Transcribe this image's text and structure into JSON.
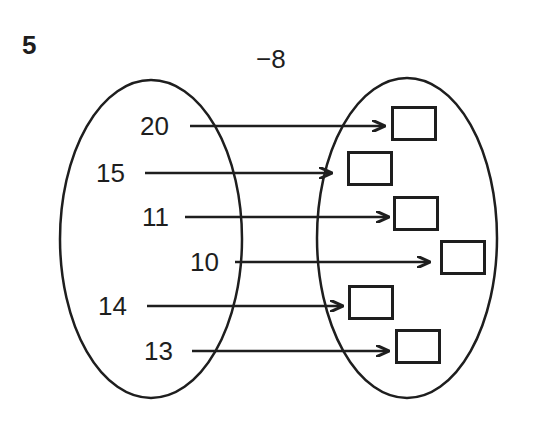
{
  "question_number": "5",
  "rule_label": "−8",
  "colors": {
    "ink": "#1e1e1e",
    "background": "#ffffff"
  },
  "mapping": {
    "input_set_label": "inputs",
    "output_set_label": "outputs",
    "items": [
      {
        "input": "20",
        "output": ""
      },
      {
        "input": "15",
        "output": ""
      },
      {
        "input": "11",
        "output": ""
      },
      {
        "input": "10",
        "output": ""
      },
      {
        "input": "14",
        "output": ""
      },
      {
        "input": "13",
        "output": ""
      }
    ]
  }
}
